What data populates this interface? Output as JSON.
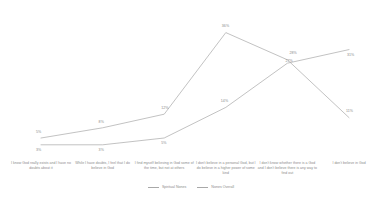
{
  "chart_data": {
    "type": "line",
    "title": "",
    "subtitle": "",
    "xlabel": "",
    "ylabel": "",
    "ylim": [
      0,
      40
    ],
    "grid": false,
    "legend_position": "bottom-center",
    "value_suffix": "%",
    "categories": [
      "I know God really exists and I have no doubts about it",
      "While I have doubts, I feel that I do believe in God",
      "I find myself believing in God some of the time, but not at others",
      "I don't believe in a personal God, but I do believe in a higher power of some kind",
      "I don't know whether there is a God and I don't believe there is any way to find out",
      "I don't believe in God"
    ],
    "series": [
      {
        "name": "Spiritual Nones",
        "color": "#a8a8a8",
        "values": [
          5,
          8,
          12,
          36,
          28,
          11
        ],
        "labels": [
          "5%",
          "8%",
          "12%",
          "36%",
          "28%",
          "11%"
        ]
      },
      {
        "name": "Nones Overall",
        "color": "#a8a8a8",
        "values": [
          3,
          3,
          5,
          14,
          27,
          31
        ],
        "labels": [
          "3%",
          "3%",
          "5%",
          "14%",
          "27%",
          "31%"
        ]
      }
    ]
  },
  "legend": {
    "items": [
      {
        "label": "Spiritual Nones"
      },
      {
        "label": "Nones Overall"
      }
    ]
  }
}
